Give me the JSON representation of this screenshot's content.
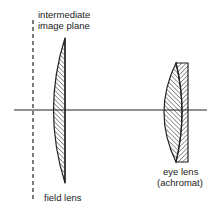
{
  "diagram": {
    "labels": {
      "image_plane_line1": "intermediate",
      "image_plane_line2": "image plane",
      "field_lens": "field lens",
      "eye_lens_line1": "eye lens",
      "eye_lens_line2": "(achromat)"
    },
    "elements": [
      {
        "id": "intermediate-image-plane",
        "type": "dashed-line"
      },
      {
        "id": "optical-axis",
        "type": "line"
      },
      {
        "id": "field-lens",
        "type": "plano-convex lens"
      },
      {
        "id": "eye-lens",
        "type": "achromatic doublet"
      }
    ],
    "colors": {
      "line": "#222222",
      "background": "#ffffff"
    }
  }
}
